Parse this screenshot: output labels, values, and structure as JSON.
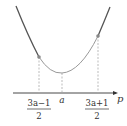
{
  "diagram": {
    "axis": {
      "label": "p"
    },
    "ticks": [
      {
        "id": "left",
        "numerator": "3a−1",
        "denominator": "2"
      },
      {
        "id": "vertex",
        "label": "a"
      },
      {
        "id": "right",
        "numerator": "3a+1",
        "denominator": "2"
      }
    ],
    "colors": {
      "curve_outer": "#555555",
      "curve_inner": "#999999",
      "dashed": "#aaaaaa",
      "axis": "#333333",
      "point": "#888888"
    }
  }
}
